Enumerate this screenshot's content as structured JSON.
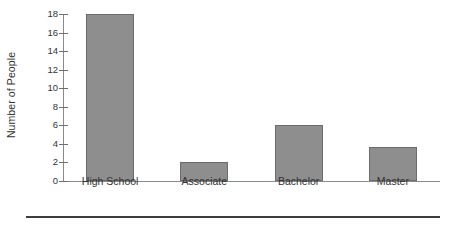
{
  "chart_data": {
    "type": "bar",
    "title": "",
    "xlabel": "",
    "ylabel": "Number of People",
    "categories": [
      "High School",
      "Associate",
      "Bachelor",
      "Master"
    ],
    "values": [
      18,
      2,
      6,
      3.7
    ],
    "ylim": [
      0,
      18
    ],
    "yticks": [
      0,
      2,
      4,
      6,
      8,
      10,
      12,
      14,
      16,
      18
    ],
    "ytick_labels": [
      "0",
      "2",
      "4",
      "6",
      "8",
      "10",
      "12",
      "14",
      "16",
      "18"
    ],
    "grid": false,
    "legend": null,
    "legend_position": "none",
    "series": [
      {
        "name": "Number of People",
        "values": [
          18,
          2,
          6,
          3.7
        ]
      }
    ],
    "colors": {
      "bar_fill": "#8e8e8e",
      "bar_border": "#6b6b6b",
      "axis_line": "#8a8a8a",
      "tick_mark": "#6e6e6e",
      "text": "#333333",
      "bottom_rule": "#3d3d3d",
      "background": "#ffffff"
    }
  }
}
